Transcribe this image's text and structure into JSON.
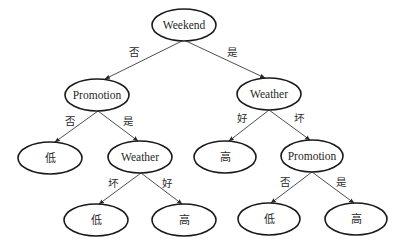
{
  "diagram": {
    "type": "decision-tree",
    "colors": {
      "stroke": "#1a1a1a",
      "text": "#1f1f1f",
      "background": "#ffffff"
    },
    "nodes": [
      {
        "id": "root",
        "label": "Weekend",
        "kind": "decision",
        "cx": 184,
        "cy": 25,
        "rx": 32,
        "ry": 16
      },
      {
        "id": "promo_left",
        "label": "Promotion",
        "kind": "decision",
        "cx": 97,
        "cy": 95,
        "rx": 32,
        "ry": 16
      },
      {
        "id": "weather_right",
        "label": "Weather",
        "kind": "decision",
        "cx": 269,
        "cy": 94,
        "rx": 32,
        "ry": 16
      },
      {
        "id": "leaf_low_1",
        "label": "低",
        "kind": "leaf",
        "cx": 50,
        "cy": 158,
        "rx": 32,
        "ry": 16
      },
      {
        "id": "weather_mid",
        "label": "Weather",
        "kind": "decision",
        "cx": 140,
        "cy": 157,
        "rx": 32,
        "ry": 16
      },
      {
        "id": "leaf_high_1",
        "label": "高",
        "kind": "leaf",
        "cx": 225,
        "cy": 157,
        "rx": 31,
        "ry": 16
      },
      {
        "id": "promo_right",
        "label": "Promotion",
        "kind": "decision",
        "cx": 312,
        "cy": 156,
        "rx": 31,
        "ry": 16
      },
      {
        "id": "leaf_low_2",
        "label": "低",
        "kind": "leaf",
        "cx": 96,
        "cy": 220,
        "rx": 32,
        "ry": 16
      },
      {
        "id": "leaf_high_2",
        "label": "高",
        "kind": "leaf",
        "cx": 184,
        "cy": 220,
        "rx": 32,
        "ry": 16
      },
      {
        "id": "leaf_low_3",
        "label": "低",
        "kind": "leaf",
        "cx": 269,
        "cy": 219,
        "rx": 31,
        "ry": 16
      },
      {
        "id": "leaf_high_3",
        "label": "高",
        "kind": "leaf",
        "cx": 356,
        "cy": 219,
        "rx": 31,
        "ry": 16
      }
    ],
    "edges": [
      {
        "from": "root",
        "to": "promo_left",
        "label": "否",
        "x1": 182,
        "y1": 41,
        "x2": 105,
        "y2": 79,
        "lx": 134,
        "ly": 52
      },
      {
        "from": "root",
        "to": "weather_right",
        "label": "是",
        "x1": 186,
        "y1": 41,
        "x2": 265,
        "y2": 78,
        "lx": 232,
        "ly": 52
      },
      {
        "from": "promo_left",
        "to": "leaf_low_1",
        "label": "否",
        "x1": 98,
        "y1": 111,
        "x2": 55,
        "y2": 142,
        "lx": 70,
        "ly": 121
      },
      {
        "from": "promo_left",
        "to": "weather_mid",
        "label": "是",
        "x1": 98,
        "y1": 111,
        "x2": 138,
        "y2": 141,
        "lx": 128,
        "ly": 121
      },
      {
        "from": "weather_right",
        "to": "leaf_high_1",
        "label": "好",
        "x1": 269,
        "y1": 110,
        "x2": 229,
        "y2": 141,
        "lx": 242,
        "ly": 118
      },
      {
        "from": "weather_right",
        "to": "promo_right",
        "label": "坏",
        "x1": 269,
        "y1": 110,
        "x2": 310,
        "y2": 140,
        "lx": 299,
        "ly": 118
      },
      {
        "from": "weather_mid",
        "to": "leaf_low_2",
        "label": "坏",
        "x1": 141,
        "y1": 173,
        "x2": 99,
        "y2": 204,
        "lx": 113,
        "ly": 183
      },
      {
        "from": "weather_mid",
        "to": "leaf_high_2",
        "label": "好",
        "x1": 141,
        "y1": 173,
        "x2": 182,
        "y2": 204,
        "lx": 167,
        "ly": 183
      },
      {
        "from": "promo_right",
        "to": "leaf_low_3",
        "label": "否",
        "x1": 312,
        "y1": 172,
        "x2": 271,
        "y2": 203,
        "lx": 285,
        "ly": 182
      },
      {
        "from": "promo_right",
        "to": "leaf_high_3",
        "label": "是",
        "x1": 312,
        "y1": 172,
        "x2": 354,
        "y2": 203,
        "lx": 341,
        "ly": 182
      }
    ]
  }
}
